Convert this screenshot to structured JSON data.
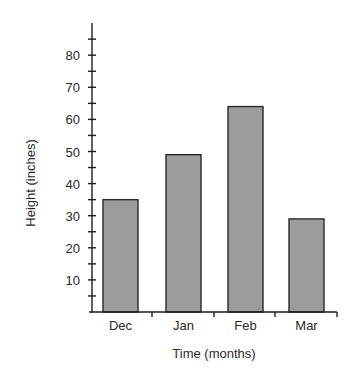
{
  "chart_data": {
    "type": "bar",
    "title": "",
    "xlabel": "Time (months)",
    "ylabel": "Height (inches)",
    "categories": [
      "Dec",
      "Jan",
      "Feb",
      "Mar"
    ],
    "values": [
      35,
      49,
      64,
      29
    ],
    "ylim": [
      0,
      90
    ],
    "y_ticks_labeled": [
      10,
      20,
      30,
      40,
      50,
      60,
      70,
      80
    ],
    "y_minor_tick_step": 5,
    "grid": false,
    "legend": null,
    "colors": {
      "bar_fill": "#9c9c9c",
      "bar_stroke": "#2a2a2a",
      "axis": "#1e1e1e"
    }
  }
}
